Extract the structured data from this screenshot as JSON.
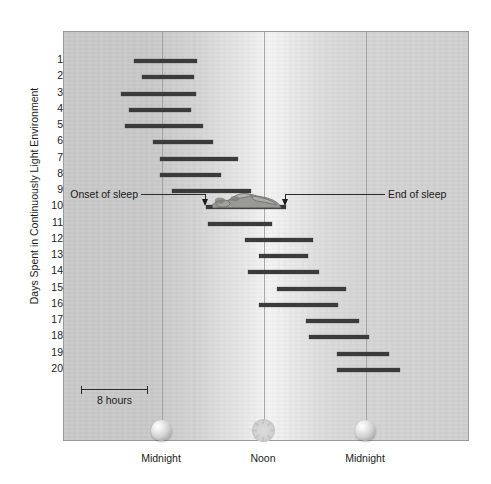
{
  "chart_data": {
    "type": "bar",
    "chart_kind": "actogram-horizontal-range-bars",
    "title": "",
    "xlabel": "",
    "ylabel": "Days Spent in Continuously Light Environment",
    "ylim": [
      1,
      20
    ],
    "xlim_hours": [
      -4.1,
      28.0
    ],
    "x_unit": "hours of day",
    "grid": true,
    "legend_position": "none",
    "x_gridlines": [
      {
        "label": "Midnight",
        "hour": 0
      },
      {
        "label": "Noon",
        "hour": 12
      },
      {
        "label": "Midnight",
        "hour": 24
      }
    ],
    "x_tick_labels": [
      "Midnight",
      "Noon",
      "Midnight"
    ],
    "y_tick_labels": [
      "1",
      "2",
      "3",
      "4",
      "5",
      "6",
      "7",
      "8",
      "9",
      "10",
      "11",
      "12",
      "13",
      "14",
      "15",
      "16",
      "17",
      "18",
      "19",
      "20"
    ],
    "y_major_ticks": [
      5,
      10,
      15,
      20
    ],
    "scale_bar": {
      "label": "8 hours",
      "hours": 8
    },
    "categories": [
      "1",
      "2",
      "3",
      "4",
      "5",
      "6",
      "7",
      "8",
      "9",
      "10",
      "11",
      "12",
      "13",
      "14",
      "15",
      "16",
      "17",
      "18",
      "19",
      "20"
    ],
    "series": [
      {
        "name": "Sleep episode",
        "units": "hours after midnight",
        "bars": [
          {
            "day": 1,
            "start": -3.3,
            "end": 4.1
          },
          {
            "day": 2,
            "start": -2.3,
            "end": 3.8
          },
          {
            "day": 3,
            "start": -4.8,
            "end": 4.0
          },
          {
            "day": 4,
            "start": -3.9,
            "end": 3.4
          },
          {
            "day": 5,
            "start": -4.3,
            "end": 4.8
          },
          {
            "day": 6,
            "start": -1.1,
            "end": 6.0
          },
          {
            "day": 7,
            "start": -0.2,
            "end": 8.9
          },
          {
            "day": 8,
            "start": -0.2,
            "end": 6.9
          },
          {
            "day": 9,
            "start": 1.2,
            "end": 10.5
          },
          {
            "day": 10,
            "start": 5.2,
            "end": 14.6
          },
          {
            "day": 11,
            "start": 5.4,
            "end": 12.9
          },
          {
            "day": 12,
            "start": 9.8,
            "end": 17.8
          },
          {
            "day": 13,
            "start": 11.4,
            "end": 17.2
          },
          {
            "day": 14,
            "start": 10.1,
            "end": 18.5
          },
          {
            "day": 15,
            "start": 13.5,
            "end": 21.6
          },
          {
            "day": 16,
            "start": 11.4,
            "end": 20.7
          },
          {
            "day": 17,
            "start": 16.9,
            "end": 23.2
          },
          {
            "day": 18,
            "start": 17.3,
            "end": 24.4
          },
          {
            "day": 19,
            "start": 20.6,
            "end": 26.7
          },
          {
            "day": 20,
            "start": 20.6,
            "end": 28.0
          }
        ]
      }
    ],
    "annotations": [
      {
        "name": "onset-of-sleep",
        "text": "Onset of sleep",
        "points_to_day": 10,
        "points_to_edge": "start"
      },
      {
        "name": "end-of-sleep",
        "text": "End of sleep",
        "points_to_day": 10,
        "points_to_edge": "end"
      }
    ],
    "icons": [
      {
        "name": "moon-icon",
        "at_label": "Midnight",
        "hour": 0
      },
      {
        "name": "sun-icon",
        "at_label": "Noon",
        "hour": 12
      },
      {
        "name": "moon-icon",
        "at_label": "Midnight",
        "hour": 24
      }
    ]
  },
  "colors": {
    "bar": "#3b3b3b",
    "gridline": "#9b9b9b",
    "frame": "#9a9a9a",
    "text": "#1b1b1b",
    "annotation_line": "#2b2b2b"
  }
}
